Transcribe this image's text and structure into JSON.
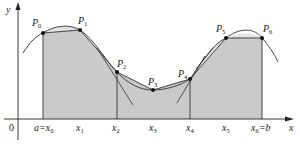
{
  "figure": {
    "colors": {
      "shade": "#c8c8c8",
      "curve": "#333333",
      "axis": "#222222",
      "point": "#111111"
    },
    "axes": {
      "x_label": "x",
      "y_label": "y",
      "origin_label": "0"
    },
    "x_ticks": [
      {
        "main": "a=x",
        "sub": "0",
        "x": 43
      },
      {
        "main": "x",
        "sub": "1",
        "x": 80
      },
      {
        "main": "x",
        "sub": "2",
        "x": 117
      },
      {
        "main": "x",
        "sub": "3",
        "x": 153
      },
      {
        "main": "x",
        "sub": "4",
        "x": 190
      },
      {
        "main": "x",
        "sub": "5",
        "x": 226
      },
      {
        "main": "x",
        "sub": "6",
        "suffix": "=b",
        "x": 262
      }
    ],
    "points": [
      {
        "name": "P",
        "sub": "0",
        "x": 43,
        "y": 33
      },
      {
        "name": "P",
        "sub": "1",
        "x": 80,
        "y": 30
      },
      {
        "name": "P",
        "sub": "2",
        "x": 117,
        "y": 72
      },
      {
        "name": "P",
        "sub": "3",
        "x": 153,
        "y": 90
      },
      {
        "name": "P",
        "sub": "4",
        "x": 190,
        "y": 79
      },
      {
        "name": "P",
        "sub": "5",
        "x": 226,
        "y": 38
      },
      {
        "name": "P",
        "sub": "6",
        "x": 262,
        "y": 38
      }
    ],
    "labels": {
      "p0": "P",
      "p0s": "0",
      "p1": "P",
      "p1s": "1",
      "p2": "P",
      "p2s": "2",
      "p3": "P",
      "p3s": "3",
      "p4": "P",
      "p4s": "4",
      "p5": "P",
      "p5s": "5",
      "p6": "P",
      "p6s": "6",
      "t0": "a=x",
      "t0s": "0",
      "t1": "x",
      "t1s": "1",
      "t2": "x",
      "t2s": "2",
      "t3": "x",
      "t3s": "3",
      "t4": "x",
      "t4s": "4",
      "t5": "x",
      "t5s": "5",
      "t6": "x",
      "t6s": "6",
      "t6b": "=b"
    }
  }
}
